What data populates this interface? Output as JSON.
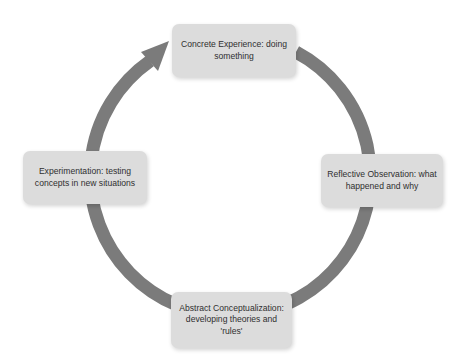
{
  "diagram": {
    "type": "cycle",
    "direction": "clockwise",
    "colors": {
      "ring": "#7b7b7b",
      "box_fill": "#dcdcdc",
      "text": "#2f2f2f",
      "background": "#ffffff"
    },
    "stages": [
      {
        "id": "concrete-experience",
        "position": "top",
        "label": "Concrete Experience: doing something"
      },
      {
        "id": "reflective-observation",
        "position": "right",
        "label": "Reflective Observation: what happened and why"
      },
      {
        "id": "abstract-conceptualization",
        "position": "bottom",
        "label": "Abstract Conceptualization: developing theories and 'rules'"
      },
      {
        "id": "experimentation",
        "position": "left",
        "label": "Experimentation: testing concepts in new situations"
      }
    ],
    "arrow": {
      "from": "experimentation",
      "to": "concrete-experience",
      "icon": "arrowhead-icon"
    }
  }
}
